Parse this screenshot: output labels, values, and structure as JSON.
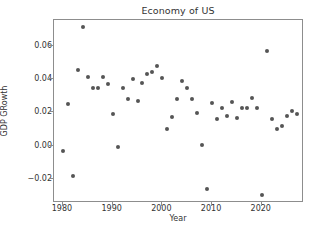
{
  "chart_data": {
    "type": "scatter",
    "title": "Economy of US",
    "xlabel": "Year",
    "ylabel": "GDP GRowth",
    "grid": false,
    "legend": null,
    "xlim": [
      1978.2,
      2028.5
    ],
    "ylim": [
      -0.0345,
      0.0755
    ],
    "xticks": [
      1980,
      1990,
      2000,
      2010,
      2020
    ],
    "xtick_labels": [
      "1980",
      "1990",
      "2000",
      "2010",
      "2020"
    ],
    "yticks": [
      -0.02,
      0.0,
      0.02,
      0.04,
      0.06
    ],
    "ytick_labels": [
      "−0.02",
      "0.00",
      "0.02",
      "0.04",
      "0.06"
    ],
    "marker": {
      "color": "#555555",
      "size": 4,
      "shape": "circle"
    },
    "x": [
      1980,
      1981,
      1982,
      1983,
      1984,
      1985,
      1986,
      1987,
      1988,
      1989,
      1990,
      1991,
      1992,
      1993,
      1994,
      1995,
      1996,
      1997,
      1998,
      1999,
      2000,
      2001,
      2002,
      2003,
      2004,
      2005,
      2006,
      2007,
      2008,
      2009,
      2010,
      2011,
      2012,
      2013,
      2014,
      2015,
      2016,
      2017,
      2018,
      2019,
      2020,
      2021,
      2022,
      2023,
      2024,
      2025,
      2026,
      2027
    ],
    "y": [
      -0.0035,
      0.025,
      -0.018,
      0.0455,
      0.0715,
      0.0415,
      0.0345,
      0.0348,
      0.0415,
      0.0368,
      0.019,
      -0.001,
      0.0348,
      0.0282,
      0.0398,
      0.0268,
      0.0378,
      0.0432,
      0.0445,
      0.0478,
      0.0405,
      0.0098,
      0.0172,
      0.0282,
      0.0388,
      0.0345,
      0.0282,
      0.0198,
      0.0005,
      -0.0262,
      0.0258,
      0.0158,
      0.0225,
      0.0178,
      0.0265,
      0.0168,
      0.0228,
      0.0228,
      0.0288,
      0.0228,
      -0.0295,
      0.0568,
      0.0158,
      0.0102,
      0.0118,
      0.0178,
      0.0208,
      0.019
    ],
    "series": [
      {
        "name": "GDP GRowth",
        "points": [
          [
            1980,
            -0.0035
          ],
          [
            1981,
            0.025
          ],
          [
            1982,
            -0.018
          ],
          [
            1983,
            0.0455
          ],
          [
            1984,
            0.0715
          ],
          [
            1985,
            0.0415
          ],
          [
            1986,
            0.0345
          ],
          [
            1987,
            0.0348
          ],
          [
            1988,
            0.0415
          ],
          [
            1989,
            0.0368
          ],
          [
            1990,
            0.019
          ],
          [
            1991,
            -0.001
          ],
          [
            1992,
            0.0348
          ],
          [
            1993,
            0.0282
          ],
          [
            1994,
            0.0398
          ],
          [
            1995,
            0.0268
          ],
          [
            1996,
            0.0378
          ],
          [
            1997,
            0.0432
          ],
          [
            1998,
            0.0445
          ],
          [
            1999,
            0.0478
          ],
          [
            2000,
            0.0405
          ],
          [
            2001,
            0.0098
          ],
          [
            2002,
            0.0172
          ],
          [
            2003,
            0.0282
          ],
          [
            2004,
            0.0388
          ],
          [
            2005,
            0.0345
          ],
          [
            2006,
            0.0282
          ],
          [
            2007,
            0.0198
          ],
          [
            2008,
            0.0005
          ],
          [
            2009,
            -0.0262
          ],
          [
            2010,
            0.0258
          ],
          [
            2011,
            0.0158
          ],
          [
            2012,
            0.0225
          ],
          [
            2013,
            0.0178
          ],
          [
            2014,
            0.0265
          ],
          [
            2015,
            0.0168
          ],
          [
            2016,
            0.0228
          ],
          [
            2017,
            0.0228
          ],
          [
            2018,
            0.0288
          ],
          [
            2019,
            0.0228
          ],
          [
            2020,
            -0.0295
          ],
          [
            2021,
            0.0568
          ],
          [
            2022,
            0.0158
          ],
          [
            2023,
            0.0102
          ],
          [
            2024,
            0.0118
          ],
          [
            2025,
            0.0178
          ],
          [
            2026,
            0.0208
          ],
          [
            2027,
            0.019
          ]
        ]
      }
    ]
  }
}
